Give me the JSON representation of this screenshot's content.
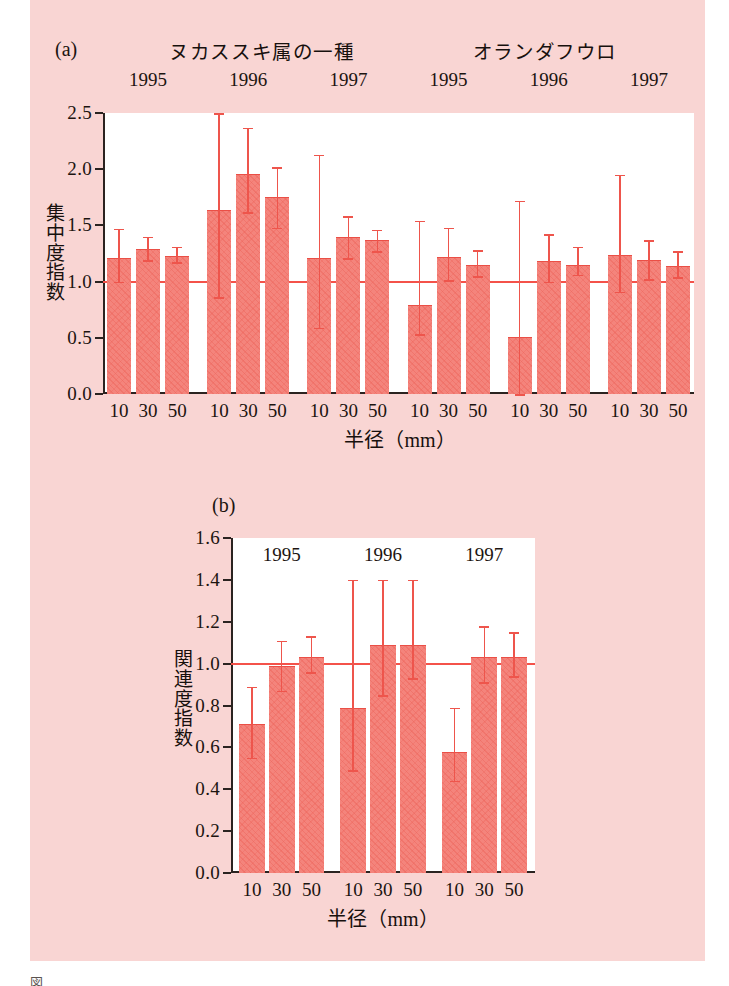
{
  "figure": {
    "caption": "図　　　　　　　　　　　　　　　　　　　　　　　　　　",
    "background_color": "#f9d5d3",
    "bar_color": "#f4847c",
    "reference_line_color": "#f4524a",
    "axis_color": "#2b2320"
  },
  "panel_a": {
    "letter": "(a)",
    "species": [
      {
        "name": "ヌカススキ属の一種"
      },
      {
        "name": "オランダフウロ"
      }
    ],
    "group_labels": [
      "1995",
      "1996",
      "1997",
      "1995",
      "1996",
      "1997"
    ],
    "xlabel": "半径（mm）",
    "ylabel": "集中度指数",
    "ylabel_chars": [
      "集",
      "中",
      "度",
      "指",
      "数"
    ],
    "chart_data": {
      "type": "bar",
      "title": "(a)",
      "xlabel": "半径（mm）",
      "ylabel": "集中度指数",
      "ylim": [
        0.0,
        2.5
      ],
      "yticks": [
        "0.0",
        "0.5",
        "1.0",
        "1.5",
        "2.0",
        "2.5"
      ],
      "ytick_values": [
        0.0,
        0.5,
        1.0,
        1.5,
        2.0,
        2.5
      ],
      "reference_line": 1.0,
      "grid": false,
      "legend": "none",
      "categories": [
        "10",
        "30",
        "50",
        "10",
        "30",
        "50",
        "10",
        "30",
        "50",
        "10",
        "30",
        "50",
        "10",
        "30",
        "50",
        "10",
        "30",
        "50"
      ],
      "groups": [
        {
          "species": "ヌカススキ属の一種",
          "year": "1995"
        },
        {
          "species": "ヌカススキ属の一種",
          "year": "1996"
        },
        {
          "species": "ヌカススキ属の一種",
          "year": "1997"
        },
        {
          "species": "オランダフウロ",
          "year": "1995"
        },
        {
          "species": "オランダフウロ",
          "year": "1996"
        },
        {
          "species": "オランダフウロ",
          "year": "1997"
        }
      ],
      "values": [
        1.21,
        1.29,
        1.23,
        1.64,
        1.96,
        1.75,
        1.21,
        1.4,
        1.37,
        0.79,
        1.22,
        1.15,
        0.51,
        1.18,
        1.15,
        1.24,
        1.19,
        1.14
      ],
      "error_low": [
        1.0,
        1.19,
        1.17,
        0.86,
        1.62,
        1.48,
        0.59,
        1.21,
        1.27,
        0.53,
        1.01,
        1.05,
        0.0,
        1.0,
        1.06,
        0.91,
        1.02,
        1.04
      ],
      "error_high": [
        1.47,
        1.4,
        1.31,
        2.5,
        2.37,
        2.02,
        2.13,
        1.58,
        1.46,
        1.54,
        1.48,
        1.28,
        1.72,
        1.42,
        1.31,
        1.95,
        1.37,
        1.27
      ]
    }
  },
  "panel_b": {
    "letter": "(b)",
    "group_labels": [
      "1995",
      "1996",
      "1997"
    ],
    "xlabel": "半径（mm）",
    "ylabel": "関連度指数",
    "ylabel_chars": [
      "関",
      "連",
      "度",
      "指",
      "数"
    ],
    "chart_data": {
      "type": "bar",
      "title": "(b)",
      "xlabel": "半径（mm）",
      "ylabel": "関連度指数",
      "ylim": [
        0.0,
        1.6
      ],
      "yticks": [
        "0.0",
        "0.2",
        "0.4",
        "0.6",
        "0.8",
        "1.0",
        "1.2",
        "1.4",
        "1.6"
      ],
      "ytick_values": [
        0.0,
        0.2,
        0.4,
        0.6,
        0.8,
        1.0,
        1.2,
        1.4,
        1.6
      ],
      "reference_line": 1.0,
      "grid": false,
      "legend": "none",
      "categories": [
        "10",
        "30",
        "50",
        "10",
        "30",
        "50",
        "10",
        "30",
        "50"
      ],
      "groups": [
        {
          "year": "1995"
        },
        {
          "year": "1996"
        },
        {
          "year": "1997"
        }
      ],
      "values": [
        0.71,
        0.99,
        1.03,
        0.79,
        1.09,
        1.09,
        0.58,
        1.03,
        1.03
      ],
      "error_low": [
        0.55,
        0.87,
        0.96,
        0.49,
        0.85,
        0.93,
        0.44,
        0.91,
        0.94
      ],
      "error_high": [
        0.89,
        1.11,
        1.13,
        1.4,
        1.4,
        1.4,
        0.79,
        1.18,
        1.15
      ]
    }
  }
}
